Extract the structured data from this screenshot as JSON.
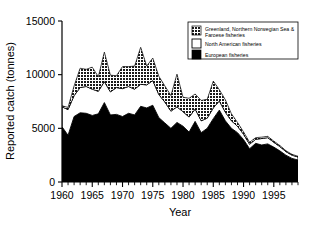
{
  "chart_data": {
    "type": "area",
    "stacked": true,
    "title": "",
    "xlabel": "Year",
    "ylabel": "Reported catch (tonnes)",
    "xlim": [
      1960,
      1999
    ],
    "ylim": [
      0,
      15000
    ],
    "ytick_values": [
      0,
      5000,
      10000,
      15000
    ],
    "ytick_labels": [
      "0",
      "5000",
      "10000",
      "15000"
    ],
    "xtick_values": [
      1960,
      1965,
      1970,
      1975,
      1980,
      1985,
      1990,
      1995
    ],
    "xtick_labels": [
      "1960",
      "1965",
      "1970",
      "1975",
      "1980",
      "1985",
      "1990",
      "1995"
    ],
    "xtick_minor_step": 1,
    "grid": false,
    "legend_position": "top-right",
    "x": [
      1960,
      1961,
      1962,
      1963,
      1964,
      1965,
      1966,
      1967,
      1968,
      1969,
      1970,
      1971,
      1972,
      1973,
      1974,
      1975,
      1976,
      1977,
      1978,
      1979,
      1980,
      1981,
      1982,
      1983,
      1984,
      1985,
      1986,
      1987,
      1988,
      1989,
      1990,
      1991,
      1992,
      1993,
      1994,
      1995,
      1996,
      1997,
      1998,
      1999
    ],
    "series": [
      {
        "name": "European fisheries",
        "color": "#000000",
        "swatch": "solid-black",
        "values": [
          5150,
          4350,
          6100,
          6450,
          6400,
          6200,
          6350,
          7400,
          6250,
          6300,
          6100,
          6400,
          6250,
          7050,
          6900,
          7150,
          6000,
          5500,
          5000,
          5550,
          5200,
          4650,
          5650,
          4600,
          5000,
          5900,
          6700,
          5700,
          5000,
          4600,
          3950,
          3100,
          3600,
          3450,
          3550,
          3250,
          2900,
          2500,
          2200,
          2050
        ]
      },
      {
        "name": "North American fisheries",
        "color": "#ffffff",
        "swatch": "white-outline",
        "values": [
          1850,
          2400,
          1950,
          2350,
          2500,
          2450,
          2100,
          1950,
          2150,
          2500,
          2600,
          2500,
          2400,
          2050,
          2150,
          2300,
          2150,
          1950,
          1600,
          1450,
          1350,
          1400,
          1150,
          1100,
          950,
          1000,
          850,
          800,
          700,
          600,
          500,
          420,
          380,
          600,
          580,
          450,
          400,
          330,
          300,
          280
        ]
      },
      {
        "name": "Greenland, Northern Norwegian Sea & Faroese fisheries",
        "color": "#2b2b2b",
        "swatch": "dark-hatch",
        "values": [
          100,
          200,
          900,
          1800,
          1600,
          2050,
          1350,
          2750,
          1550,
          1100,
          2050,
          1850,
          2150,
          3450,
          1750,
          2100,
          1700,
          1500,
          1450,
          3050,
          1350,
          1750,
          1400,
          1900,
          1750,
          2500,
          1050,
          1150,
          650,
          350,
          220,
          180,
          150,
          130,
          120,
          110,
          100,
          90,
          80,
          70
        ]
      }
    ]
  },
  "legend": {
    "entries": [
      {
        "label": "Greenland, Northern Norwegian Sea &",
        "label2": "Faroese fisheries",
        "swatch": "dark-hatch"
      },
      {
        "label": "North American fisheries",
        "label2": "",
        "swatch": "white-outline"
      },
      {
        "label": "European fisheries",
        "label2": "",
        "swatch": "solid-black"
      }
    ]
  }
}
